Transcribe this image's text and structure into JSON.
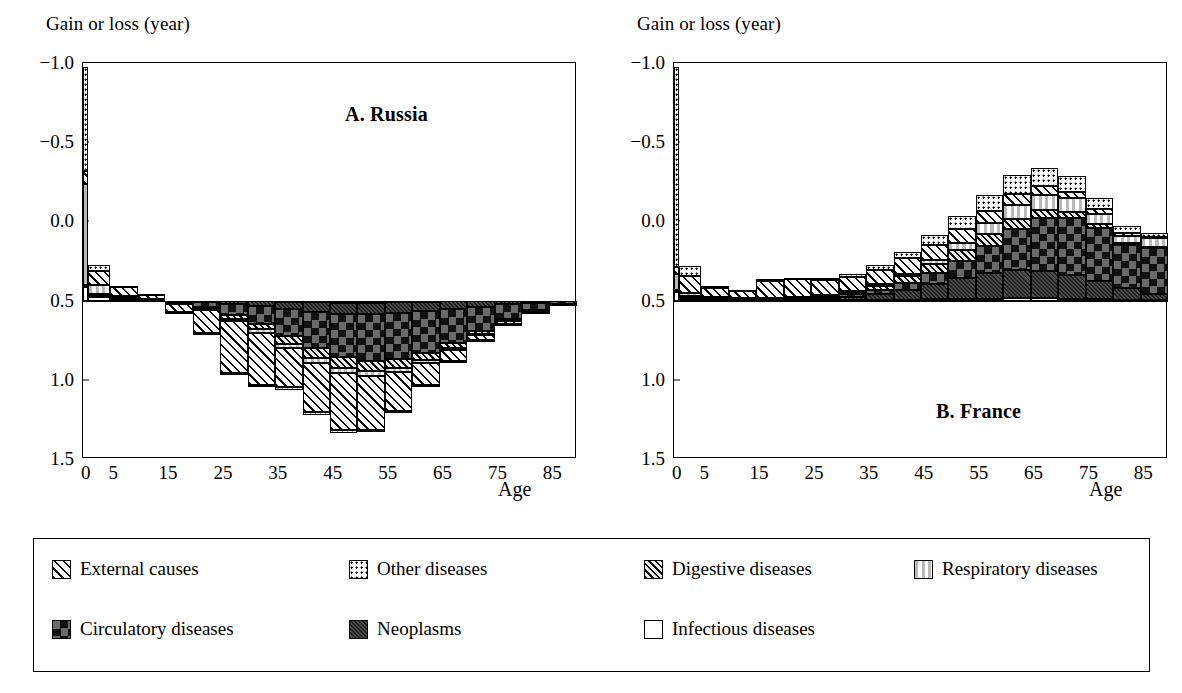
{
  "axis": {
    "ylabel": "Gain or loss (year)",
    "xlabel": "Age",
    "yticks": [
      "1.5",
      "1.0",
      "0.5",
      "0.0",
      "−0.5",
      "−1.0"
    ],
    "ytick_values": [
      1.5,
      1.0,
      0.5,
      0.0,
      -0.5,
      -1.0
    ],
    "xticks": [
      "0",
      "5",
      "15",
      "25",
      "35",
      "45",
      "55",
      "65",
      "75",
      "85"
    ]
  },
  "panels": [
    {
      "id": "russia",
      "title": "A. Russia"
    },
    {
      "id": "france",
      "title": "B. France"
    }
  ],
  "legend": {
    "rows": [
      [
        {
          "label": "External causes",
          "pattern": "p-external"
        },
        {
          "label": "Other diseases",
          "pattern": "p-other"
        },
        {
          "label": "Digestive diseases",
          "pattern": "p-digestive"
        },
        {
          "label": "Respiratory diseases",
          "pattern": "p-respiratory"
        }
      ],
      [
        {
          "label": "Circulatory diseases",
          "pattern": "p-circulatory"
        },
        {
          "label": "Neoplasms",
          "pattern": "p-neoplasms"
        },
        {
          "label": "Infectious diseases",
          "pattern": "p-infectious"
        }
      ]
    ]
  },
  "chart_data": {
    "type": "bar",
    "subtype": "stacked-diverging",
    "xlabel": "Age",
    "ylabel": "Gain or loss (year)",
    "ylim": [
      -1.0,
      1.5
    ],
    "yticks": [
      -1.0,
      -0.5,
      0.0,
      0.5,
      1.0,
      1.5
    ],
    "grid": false,
    "legend_position": "below",
    "age_groups": [
      "0",
      "1-4",
      "5-9",
      "10-14",
      "15-19",
      "20-24",
      "25-29",
      "30-34",
      "35-39",
      "40-44",
      "45-49",
      "50-54",
      "55-59",
      "60-64",
      "65-69",
      "70-74",
      "75-79",
      "80-84",
      "85+"
    ],
    "age_starts": [
      0,
      1,
      5,
      10,
      15,
      20,
      25,
      30,
      35,
      40,
      45,
      50,
      55,
      60,
      65,
      70,
      75,
      80,
      85
    ],
    "age_ends": [
      1,
      5,
      10,
      15,
      20,
      25,
      30,
      35,
      40,
      45,
      50,
      55,
      60,
      65,
      70,
      75,
      80,
      85,
      90
    ],
    "series_order": [
      "infectious",
      "neoplasms",
      "circulatory",
      "digestive",
      "respiratory",
      "external",
      "other"
    ],
    "series_labels": {
      "infectious": "Infectious diseases",
      "neoplasms": "Neoplasms",
      "circulatory": "Circulatory diseases",
      "digestive": "Digestive diseases",
      "respiratory": "Respiratory diseases",
      "external": "External causes",
      "other": "Other diseases"
    },
    "charts": [
      {
        "name": "A. Russia",
        "series": [
          {
            "name": "infectious",
            "values": [
              0.085,
              0.02,
              0.004,
              0.002,
              0.0,
              0.0,
              -0.003,
              -0.005,
              -0.008,
              -0.01,
              -0.012,
              -0.012,
              -0.01,
              -0.008,
              -0.005,
              -0.003,
              -0.002,
              -0.001,
              0.0
            ]
          },
          {
            "name": "neoplasms",
            "values": [
              0.005,
              0.008,
              0.004,
              0.002,
              -0.005,
              -0.01,
              -0.02,
              -0.03,
              -0.045,
              -0.06,
              -0.07,
              -0.075,
              -0.07,
              -0.06,
              -0.05,
              -0.035,
              -0.022,
              -0.012,
              -0.005
            ]
          },
          {
            "name": "circulatory",
            "values": [
              0.002,
              0.005,
              0.005,
              0.003,
              -0.01,
              -0.03,
              -0.07,
              -0.11,
              -0.17,
              -0.23,
              -0.275,
              -0.295,
              -0.29,
              -0.265,
              -0.215,
              -0.155,
              -0.095,
              -0.045,
              -0.015
            ]
          },
          {
            "name": "digestive",
            "values": [
              0.005,
              0.01,
              0.006,
              0.003,
              -0.004,
              -0.01,
              -0.022,
              -0.035,
              -0.05,
              -0.062,
              -0.068,
              -0.065,
              -0.055,
              -0.042,
              -0.028,
              -0.016,
              -0.008,
              -0.004,
              -0.001
            ]
          },
          {
            "name": "respiratory",
            "values": [
              0.64,
              0.055,
              0.01,
              0.003,
              -0.003,
              -0.008,
              -0.015,
              -0.022,
              -0.028,
              -0.032,
              -0.034,
              -0.032,
              -0.026,
              -0.018,
              -0.012,
              -0.007,
              -0.004,
              -0.002,
              -0.001
            ]
          },
          {
            "name": "external",
            "values": [
              0.08,
              0.09,
              0.055,
              0.025,
              -0.05,
              -0.145,
              -0.325,
              -0.33,
              -0.245,
              -0.31,
              -0.355,
              -0.335,
              -0.245,
              -0.14,
              -0.07,
              -0.035,
              -0.018,
              -0.008,
              -0.002
            ]
          },
          {
            "name": "other",
            "values": [
              0.66,
              0.035,
              0.008,
              0.003,
              -0.003,
              -0.007,
              -0.01,
              -0.014,
              -0.018,
              -0.02,
              -0.02,
              -0.018,
              -0.014,
              -0.01,
              -0.007,
              -0.004,
              -0.002,
              -0.001,
              0.0
            ]
          }
        ],
        "positive_totals": [
          1.477,
          0.223,
          0.102,
          0.041,
          0.0,
          0.0,
          0.0,
          0.0,
          0.0,
          0.0,
          0.0,
          0.0,
          0.0,
          0.0,
          0.0,
          0.0,
          0.0,
          0.0,
          0.0
        ],
        "negative_totals": [
          0.0,
          0.0,
          0.0,
          0.0,
          -0.075,
          -0.21,
          -0.465,
          -0.546,
          -0.564,
          -0.724,
          -0.834,
          -0.832,
          -0.71,
          -0.543,
          -0.387,
          -0.255,
          -0.151,
          -0.073,
          -0.024
        ]
      },
      {
        "name": "B. France",
        "series": [
          {
            "name": "infectious",
            "values": [
              0.055,
              0.008,
              0.002,
              0.001,
              0.001,
              0.002,
              0.003,
              0.004,
              0.005,
              0.006,
              0.008,
              0.01,
              0.012,
              0.014,
              0.014,
              0.012,
              0.01,
              0.006,
              0.003
            ]
          },
          {
            "name": "neoplasms",
            "values": [
              0.004,
              0.01,
              0.008,
              0.006,
              0.006,
              0.008,
              0.012,
              0.02,
              0.035,
              0.06,
              0.095,
              0.13,
              0.16,
              0.18,
              0.175,
              0.15,
              0.115,
              0.075,
              0.04
            ]
          },
          {
            "name": "circulatory",
            "values": [
              0.003,
              0.006,
              0.005,
              0.004,
              0.004,
              0.006,
              0.009,
              0.015,
              0.028,
              0.045,
              0.07,
              0.11,
              0.175,
              0.255,
              0.33,
              0.36,
              0.335,
              0.27,
              0.29
            ]
          },
          {
            "name": "digestive",
            "values": [
              0.004,
              0.008,
              0.004,
              0.003,
              0.003,
              0.005,
              0.008,
              0.014,
              0.026,
              0.042,
              0.058,
              0.07,
              0.072,
              0.065,
              0.052,
              0.038,
              0.024,
              0.014,
              0.008
            ]
          },
          {
            "name": "respiratory",
            "values": [
              0.1,
              0.016,
              0.004,
              0.002,
              0.002,
              0.003,
              0.005,
              0.008,
              0.012,
              0.018,
              0.028,
              0.045,
              0.07,
              0.09,
              0.095,
              0.085,
              0.065,
              0.045,
              0.055
            ]
          },
          {
            "name": "external",
            "values": [
              0.045,
              0.11,
              0.055,
              0.045,
              0.11,
              0.11,
              0.092,
              0.086,
              0.09,
              0.095,
              0.095,
              0.088,
              0.078,
              0.066,
              0.055,
              0.042,
              0.03,
              0.018,
              0.008
            ]
          },
          {
            "name": "other",
            "values": [
              1.265,
              0.06,
              0.012,
              0.008,
              0.008,
              0.01,
              0.014,
              0.02,
              0.03,
              0.042,
              0.058,
              0.08,
              0.1,
              0.12,
              0.118,
              0.098,
              0.07,
              0.042,
              0.022
            ]
          }
        ],
        "positive_totals": [
          1.476,
          0.218,
          0.09,
          0.069,
          0.134,
          0.144,
          0.143,
          0.167,
          0.226,
          0.308,
          0.412,
          0.533,
          0.667,
          0.79,
          0.839,
          0.785,
          0.649,
          0.47,
          0.426
        ],
        "negative_totals": [
          0.0,
          0.0,
          0.0,
          0.0,
          0.0,
          0.0,
          0.0,
          0.0,
          0.0,
          0.0,
          0.0,
          0.0,
          0.0,
          0.0,
          0.0,
          0.0,
          0.0,
          0.0,
          -0.06
        ]
      }
    ]
  }
}
